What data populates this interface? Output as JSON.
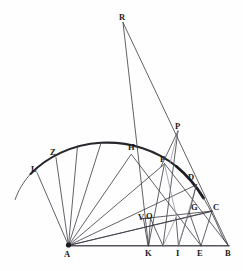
{
  "figure": {
    "kind": "geometry-diagram",
    "title": "",
    "background_color": "#fefefe",
    "stroke_color": "#3a3a42",
    "arc_color": "#26262c",
    "width": 243,
    "height": 271
  },
  "labels": [
    {
      "id": "R",
      "text": "R",
      "x": 119,
      "y": 13
    },
    {
      "id": "P",
      "text": "P",
      "x": 175,
      "y": 122
    },
    {
      "id": "H",
      "text": "H",
      "x": 128,
      "y": 143
    },
    {
      "id": "Z",
      "text": "Z",
      "x": 50,
      "y": 148
    },
    {
      "id": "F",
      "text": "F",
      "x": 160,
      "y": 155
    },
    {
      "id": "L",
      "text": "L",
      "x": 31,
      "y": 165
    },
    {
      "id": "D",
      "text": "D",
      "x": 188,
      "y": 173
    },
    {
      "id": "C",
      "text": "C",
      "x": 213,
      "y": 203
    },
    {
      "id": "G",
      "text": "G",
      "x": 191,
      "y": 203
    },
    {
      "id": "V",
      "text": "V",
      "x": 138,
      "y": 213
    },
    {
      "id": "O",
      "text": "O",
      "x": 146,
      "y": 212
    },
    {
      "id": "A",
      "text": "A",
      "x": 64,
      "y": 250
    },
    {
      "id": "K",
      "text": "K",
      "x": 145,
      "y": 249
    },
    {
      "id": "I",
      "text": "I",
      "x": 176,
      "y": 249
    },
    {
      "id": "E",
      "text": "E",
      "x": 197,
      "y": 249
    },
    {
      "id": "B",
      "text": "B",
      "x": 225,
      "y": 249
    }
  ],
  "points": {
    "A": {
      "x": 68.5,
      "y": 245.5
    },
    "B": {
      "x": 228.5,
      "y": 245.5
    },
    "C": {
      "x": 211.0,
      "y": 211.0
    },
    "D": {
      "x": 196.5,
      "y": 184.0
    },
    "E": {
      "x": 201.0,
      "y": 245.5
    },
    "F": {
      "x": 164.5,
      "y": 163.5
    },
    "G": {
      "x": 189.0,
      "y": 211.5
    },
    "H": {
      "x": 131.5,
      "y": 154.5
    },
    "I": {
      "x": 178.5,
      "y": 245.5
    },
    "K": {
      "x": 148.5,
      "y": 245.5
    },
    "L": {
      "x": 38.0,
      "y": 173.0
    },
    "O": {
      "x": 150.0,
      "y": 218.5
    },
    "P": {
      "x": 178.0,
      "y": 131.0
    },
    "R": {
      "x": 123.0,
      "y": 22.0
    },
    "V": {
      "x": 143.5,
      "y": 218.5
    },
    "Z": {
      "x": 56.5,
      "y": 158.0
    }
  },
  "arc": {
    "center": {
      "x": 100.5,
      "y": 244.0
    },
    "radius": 101.5,
    "start_angle_deg": 186,
    "end_angle_deg": 341,
    "description": "Large circular arc through L, Z, apex, H, F, D, C toward B"
  },
  "rays_from_A": [
    {
      "to": "L"
    },
    {
      "to": "Z"
    },
    {
      "to": "arc-1"
    },
    {
      "to": "arc-2"
    },
    {
      "to": "H"
    },
    {
      "to": "F"
    },
    {
      "to": "D"
    },
    {
      "to": "C"
    },
    {
      "to": "B"
    }
  ],
  "notes": {
    "baseline": "A to B horizontal diameter",
    "fan": "Nine rays radiate from vertex A to arc points",
    "upper_lines": "Two long lines from R descend to K and to B region; P is an intersection vertex above the arc"
  }
}
